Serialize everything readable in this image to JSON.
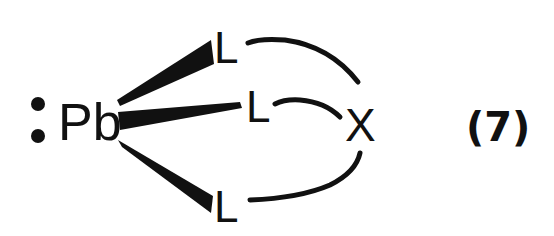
{
  "diagram": {
    "type": "chemical-structure",
    "central_atom": "Pb",
    "lone_pair": ":",
    "ligands": [
      {
        "label": "L",
        "position": "top",
        "bond": "wedge"
      },
      {
        "label": "L",
        "position": "middle",
        "bond": "wedge"
      },
      {
        "label": "L",
        "position": "bottom",
        "bond": "wedge"
      }
    ],
    "bridge_atom": "X",
    "equation_number": "(7)",
    "colors": {
      "ink": "#111111",
      "background": "#ffffff"
    }
  }
}
